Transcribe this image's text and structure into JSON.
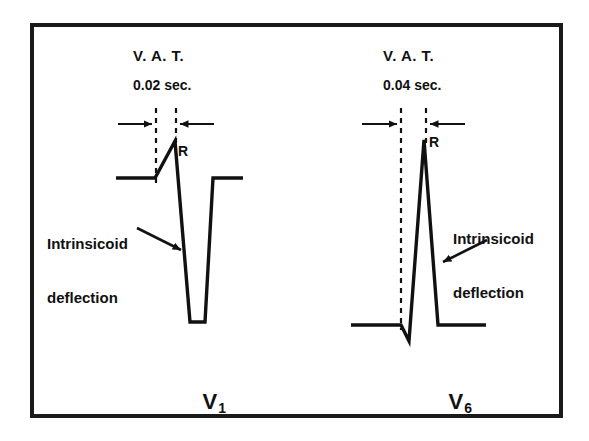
{
  "figure": {
    "border_color": "#1a1a1a",
    "trace_color": "#111111",
    "background_color": "#ffffff"
  },
  "panels": [
    {
      "id": "v1",
      "lead_label": "V",
      "lead_subscript": "1",
      "vat_title": "V. A. T.",
      "vat_value": "0.02 sec.",
      "r_label": "R",
      "annotation_line1": "Intrinsicoid",
      "annotation_line2": "deflection",
      "vat_seconds": 0.02,
      "morphology": "small R wave, deep S wave (rS complex)"
    },
    {
      "id": "v6",
      "lead_label": "V",
      "lead_subscript": "6",
      "vat_title": "V. A. T.",
      "vat_value": "0.04 sec.",
      "r_label": "R",
      "annotation_line1": "Intrinsicoid",
      "annotation_line2": "deflection",
      "vat_seconds": 0.04,
      "morphology": "small q wave, tall R wave (qR complex)"
    }
  ]
}
